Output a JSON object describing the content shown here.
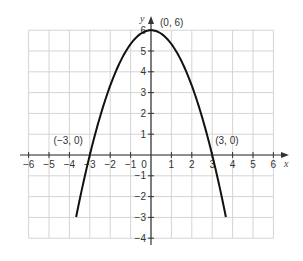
{
  "chart_data": {
    "type": "line",
    "title": "",
    "xlabel": "x",
    "ylabel": "y",
    "xlim": [
      -6,
      6
    ],
    "ylim": [
      -4,
      6
    ],
    "grid": true,
    "x_ticks": [
      -6,
      -5,
      -4,
      -3,
      -2,
      -1,
      0,
      1,
      2,
      3,
      4,
      5,
      6
    ],
    "y_ticks": [
      -4,
      -3,
      -2,
      -1,
      1,
      2,
      3,
      4,
      5,
      6
    ],
    "x_tick_labels": [
      "−6",
      "−5",
      "−4",
      "−3",
      "−2",
      "−1",
      "0",
      "1",
      "2",
      "3",
      "4",
      "5",
      "6"
    ],
    "y_tick_labels": [
      "−4",
      "−3",
      "−2",
      "−1",
      "1",
      "2",
      "3",
      "4",
      "5",
      "6"
    ],
    "series": [
      {
        "name": "parabola",
        "equation": "y = 6 - (2/3)x^2",
        "x_range": [
          -3.67,
          3.67
        ],
        "points": [
          [
            -3.67,
            -3
          ],
          [
            -3,
            0
          ],
          [
            -2,
            3.33
          ],
          [
            -1,
            5.33
          ],
          [
            0,
            6
          ],
          [
            1,
            5.33
          ],
          [
            2,
            3.33
          ],
          [
            3,
            0
          ],
          [
            3.67,
            -3
          ]
        ]
      }
    ],
    "annotations": [
      {
        "label": "(0, 6)",
        "x": 0,
        "y": 6
      },
      {
        "label": "(−3, 0)",
        "x": -3,
        "y": 0
      },
      {
        "label": "(3, 0)",
        "x": 3,
        "y": 0
      }
    ]
  },
  "colors": {
    "grid": "#d4d4d4",
    "axis": "#333333",
    "curve": "#111111"
  }
}
